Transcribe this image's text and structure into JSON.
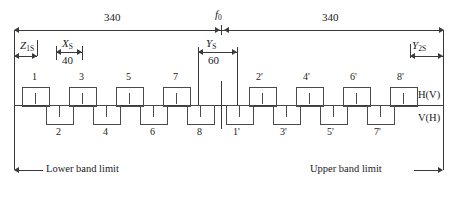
{
  "diagram": {
    "top_dimensions": [
      {
        "name": "left-span",
        "value": "340"
      },
      {
        "name": "right-span",
        "value": "340"
      }
    ],
    "center_marker": {
      "symbol": "f",
      "subscript": "0"
    },
    "dimensions": [
      {
        "name": "Z1S",
        "symbol": "Z",
        "subscript": "1S",
        "value": ""
      },
      {
        "name": "XS",
        "symbol": "X",
        "subscript": "S",
        "value": "40"
      },
      {
        "name": "YS",
        "symbol": "Y",
        "subscript": "S",
        "value": "60"
      },
      {
        "name": "Y2S",
        "symbol": "Y",
        "subscript": "2S",
        "value": ""
      }
    ],
    "upper_channels": [
      "1",
      "3",
      "5",
      "7",
      "2'",
      "4'",
      "6'",
      "8'"
    ],
    "lower_channels": [
      "2",
      "4",
      "6",
      "8",
      "1'",
      "3'",
      "5'",
      "7'"
    ],
    "polarisation_labels": {
      "upper": "H(V)",
      "lower": "V(H)"
    },
    "band_limits": {
      "lower": "Lower band limit",
      "upper": "Upper band limit"
    },
    "colors": {
      "line": "#3a3a3a",
      "rect_border": "#4a4a4a",
      "background": "#ffffff"
    }
  }
}
